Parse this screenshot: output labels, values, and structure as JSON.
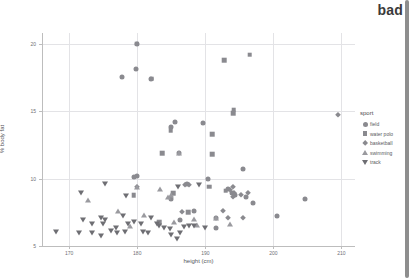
{
  "banner": {
    "label": "bad"
  },
  "chart_data": {
    "type": "scatter",
    "title": "",
    "xlabel": "height (cm)",
    "ylabel": "% body fat",
    "xlim": [
      166,
      212
    ],
    "ylim": [
      5,
      20.8
    ],
    "xticks": [
      170,
      180,
      190,
      200,
      210
    ],
    "yticks": [
      5,
      10,
      15,
      20
    ],
    "grid": true,
    "legend": {
      "title": "sport",
      "position": "right",
      "entries": [
        {
          "label": "field",
          "marker": "circle"
        },
        {
          "label": "water polo",
          "marker": "square"
        },
        {
          "label": "basketball",
          "marker": "diamond"
        },
        {
          "label": "swimming",
          "marker": "triangle-up"
        },
        {
          "label": "track",
          "marker": "triangle-down"
        }
      ]
    },
    "series": [
      {
        "name": "field",
        "marker": "circle",
        "points": [
          [
            180.0,
            20.0
          ],
          [
            179.8,
            18.1
          ],
          [
            177.8,
            17.5
          ],
          [
            182.0,
            17.4
          ],
          [
            185.5,
            14.2
          ],
          [
            189.6,
            14.1
          ],
          [
            185.0,
            13.8
          ],
          [
            186.2,
            11.9
          ],
          [
            179.9,
            10.2
          ],
          [
            179.5,
            10.1
          ],
          [
            190.4,
            10.0
          ],
          [
            195.5,
            10.7
          ],
          [
            187.3,
            9.6
          ],
          [
            193.4,
            9.2
          ],
          [
            193.9,
            8.9
          ],
          [
            194.4,
            8.8
          ],
          [
            196.0,
            8.65
          ],
          [
            185.0,
            8.5
          ],
          [
            204.6,
            8.45
          ],
          [
            197.0,
            8.2
          ],
          [
            188.3,
            7.6
          ],
          [
            191.5,
            7.1
          ],
          [
            200.6,
            7.2
          ],
          [
            186.3,
            6.9
          ],
          [
            191.6,
            6.3
          ]
        ]
      },
      {
        "name": "water polo",
        "marker": "square",
        "points": [
          [
            192.8,
            18.8
          ],
          [
            196.5,
            19.2
          ],
          [
            194.2,
            15.1
          ],
          [
            194.1,
            14.85
          ],
          [
            179.9,
            20.0
          ],
          [
            182.1,
            17.4
          ],
          [
            184.9,
            13.6
          ],
          [
            191.0,
            13.3
          ],
          [
            183.7,
            11.9
          ],
          [
            191.0,
            11.8
          ],
          [
            185.3,
            8.9
          ],
          [
            179.5,
            8.75
          ],
          [
            190.6,
            9.4
          ],
          [
            187.5,
            7.5
          ],
          [
            183.2,
            6.75
          ],
          [
            193.0,
            9.1
          ]
        ]
      },
      {
        "name": "basketball",
        "marker": "diamond",
        "points": [
          [
            209.5,
            14.7
          ],
          [
            179.9,
            9.35
          ],
          [
            187.0,
            9.55
          ],
          [
            187.6,
            9.5
          ],
          [
            194.0,
            9.4
          ],
          [
            193.7,
            9.15
          ],
          [
            194.2,
            8.9
          ],
          [
            196.3,
            8.9
          ],
          [
            195.2,
            8.75
          ],
          [
            186.6,
            7.5
          ],
          [
            193.4,
            7.05
          ],
          [
            192.6,
            7.6
          ],
          [
            195.6,
            7.1
          ],
          [
            194.0,
            8.6
          ]
        ]
      },
      {
        "name": "swimming",
        "marker": "triangle-up",
        "points": [
          [
            186.2,
            11.9
          ],
          [
            183.3,
            9.25
          ],
          [
            180.0,
            9.35
          ],
          [
            184.5,
            8.6
          ],
          [
            184.9,
            8.75
          ],
          [
            172.8,
            8.4
          ],
          [
            177.2,
            7.6
          ],
          [
            181.0,
            7.3
          ],
          [
            191.5,
            7.05
          ],
          [
            188.4,
            7.0
          ],
          [
            193.6,
            6.6
          ],
          [
            188.8,
            6.55
          ],
          [
            185.4,
            6.75
          ],
          [
            179.0,
            6.5
          ]
        ]
      },
      {
        "name": "track",
        "marker": "triangle-down",
        "points": [
          [
            175.3,
            9.6
          ],
          [
            171.7,
            8.9
          ],
          [
            178.4,
            8.7
          ],
          [
            186.0,
            9.4
          ],
          [
            189.0,
            9.5
          ],
          [
            177.9,
            7.25
          ],
          [
            174.6,
            7.1
          ],
          [
            175.2,
            6.9
          ],
          [
            174.9,
            6.65
          ],
          [
            178.6,
            6.65
          ],
          [
            179.5,
            6.75
          ],
          [
            180.6,
            6.6
          ],
          [
            182.9,
            6.6
          ],
          [
            183.2,
            6.5
          ],
          [
            184.0,
            6.35
          ],
          [
            184.8,
            6.25
          ],
          [
            186.8,
            6.4
          ],
          [
            187.6,
            6.5
          ],
          [
            188.3,
            6.45
          ],
          [
            190.0,
            6.3
          ],
          [
            168.0,
            6.05
          ],
          [
            171.4,
            5.95
          ],
          [
            173.4,
            6.0
          ],
          [
            174.6,
            5.75
          ],
          [
            176.2,
            6.1
          ],
          [
            177.0,
            5.95
          ],
          [
            178.2,
            6.05
          ],
          [
            180.9,
            6.05
          ],
          [
            181.6,
            6.0
          ],
          [
            185.0,
            5.8
          ],
          [
            185.8,
            5.5
          ],
          [
            182.0,
            7.05
          ],
          [
            176.9,
            6.35
          ],
          [
            172.0,
            6.95
          ],
          [
            173.3,
            6.6
          ],
          [
            186.3,
            6.0
          ]
        ]
      }
    ]
  }
}
